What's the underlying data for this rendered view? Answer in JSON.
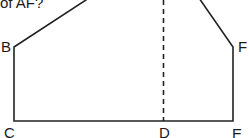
{
  "question": {
    "text": "of AF?"
  },
  "diagram": {
    "type": "polygon-with-dashed-line",
    "stroke_color": "#222222",
    "vertices": {
      "B": "B",
      "C": "C",
      "D": "D",
      "E": "E",
      "F": "F"
    },
    "edges": [
      "A-B",
      "B-C",
      "C-D",
      "D-E",
      "E-F",
      "F-A"
    ],
    "dashed_segment": "D (vertical line upward toward A)"
  }
}
